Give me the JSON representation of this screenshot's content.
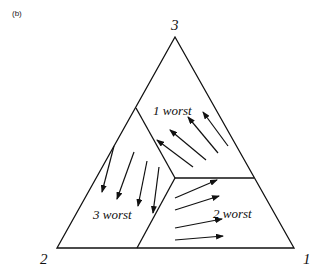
{
  "panel_label": "(b)",
  "vertices": {
    "top": {
      "label": "3"
    },
    "bottom_left": {
      "label": "2"
    },
    "bottom_right": {
      "label": "1"
    }
  },
  "regions": [
    {
      "id": "region-1",
      "label": "1 worst",
      "arrow_direction": "up-left (toward vertex 3 / left edge)",
      "arrow_count": 4
    },
    {
      "id": "region-2",
      "label": "2 worst",
      "arrow_direction": "right (toward vertex 1 edge)",
      "arrow_count": 4
    },
    {
      "id": "region-3",
      "label": "3 worst",
      "arrow_direction": "down-left (toward vertex 2 / base)",
      "arrow_count": 4
    }
  ],
  "colors": {
    "stroke": "#111111",
    "background": "#ffffff"
  }
}
